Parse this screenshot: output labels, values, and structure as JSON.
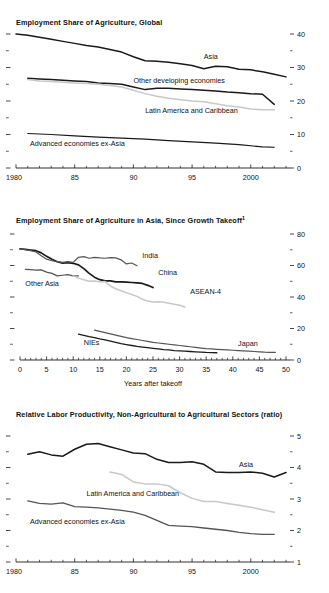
{
  "figure": {
    "background": "#ffffff",
    "colors": {
      "black": "#1a1a1a",
      "dark_gray": "#555555",
      "mid_gray": "#808080",
      "light_gray": "#c8c8c8",
      "axis": "#1a1a1a"
    }
  },
  "chart_data": [
    {
      "id": "panel1",
      "type": "line",
      "title": "Employment Share of Agriculture, Global",
      "xlabel": "",
      "ylabel": "",
      "xlim": [
        1980,
        2003
      ],
      "ylim": [
        0,
        40
      ],
      "yticks": [
        0,
        10,
        20,
        30,
        40
      ],
      "ytick_labels": [
        "0",
        "10",
        "20",
        "30",
        "40"
      ],
      "y_minor_step": 5,
      "xticks": [
        1980,
        1985,
        1990,
        1995,
        2000
      ],
      "xtick_labels": [
        "1980",
        "85",
        "90",
        "95",
        "2000"
      ],
      "x_minor_step": 1,
      "grid": false,
      "legend_position": "inline-annotations",
      "axis_side": "right",
      "series": [
        {
          "name": "Asia",
          "color": "#1a1a1a",
          "width": 1.5,
          "label_x": 1996.0,
          "label_y": 32.6,
          "x": [
            1980,
            1981,
            1982,
            1983,
            1984,
            1985,
            1986,
            1987,
            1988,
            1989,
            1990,
            1991,
            1992,
            1993,
            1994,
            1995,
            1996,
            1997,
            1998,
            1999,
            2000,
            2001,
            2002,
            2003
          ],
          "values": [
            40.0,
            39.6,
            39.0,
            38.4,
            37.8,
            37.2,
            36.6,
            36.1,
            35.4,
            34.6,
            33.2,
            32.0,
            31.9,
            31.6,
            31.1,
            30.6,
            29.6,
            30.4,
            30.2,
            29.5,
            29.3,
            28.7,
            28.0,
            27.2
          ]
        },
        {
          "name": "Other developing economies",
          "color": "#1a1a1a",
          "width": 1.5,
          "label_x": 1990.0,
          "label_y": 25.3,
          "x": [
            1981,
            1982,
            1983,
            1984,
            1985,
            1986,
            1987,
            1988,
            1989,
            1990,
            1991,
            1992,
            1993,
            1994,
            1995,
            1996,
            1997,
            1998,
            1999,
            2000,
            2001,
            2002
          ],
          "values": [
            26.8,
            26.6,
            26.4,
            26.2,
            26.0,
            25.8,
            25.4,
            25.2,
            25.0,
            24.2,
            23.4,
            23.8,
            23.8,
            23.6,
            23.4,
            23.2,
            23.0,
            22.7,
            22.5,
            22.2,
            22.0,
            19.0
          ]
        },
        {
          "name": "Latin America and Caribbean",
          "color": "#c8c8c8",
          "width": 1.5,
          "label_x": 1991.0,
          "label_y": 16.5,
          "x": [
            1981,
            1982,
            1983,
            1984,
            1985,
            1986,
            1987,
            1988,
            1989,
            1990,
            1991,
            1992,
            1993,
            1994,
            1995,
            1996,
            1997,
            1998,
            1999,
            2000,
            2001,
            2002
          ],
          "values": [
            26.4,
            26.0,
            25.8,
            25.6,
            25.4,
            25.2,
            25.0,
            24.6,
            24.2,
            23.2,
            22.2,
            21.4,
            20.8,
            20.4,
            20.0,
            19.8,
            19.2,
            18.6,
            18.2,
            17.6,
            17.4,
            17.4
          ]
        },
        {
          "name": "Advanced economies ex-Asia",
          "color": "#1a1a1a",
          "width": 1.2,
          "label_x": 1981.2,
          "label_y": 6.6,
          "x": [
            1981,
            1983,
            1985,
            1987,
            1989,
            1991,
            1993,
            1995,
            1997,
            1999,
            2001,
            2002
          ],
          "values": [
            10.3,
            10.0,
            9.6,
            9.2,
            8.9,
            8.6,
            8.2,
            7.8,
            7.4,
            7.0,
            6.3,
            6.2
          ]
        }
      ]
    },
    {
      "id": "panel2",
      "type": "line",
      "title": "Employment Share of Agriculture in Asia, Since Growth Takeoff",
      "title_footnote": "1",
      "xlabel": "Years after takeoff",
      "ylabel": "",
      "xlim": [
        0,
        50
      ],
      "ylim": [
        0,
        80
      ],
      "yticks": [
        0,
        20,
        40,
        60,
        80
      ],
      "ytick_labels": [
        "0",
        "20",
        "40",
        "60",
        "80"
      ],
      "y_minor_step": 10,
      "xticks": [
        0,
        5,
        10,
        15,
        20,
        25,
        30,
        35,
        40,
        45,
        50
      ],
      "xtick_labels": [
        "0",
        "5",
        "10",
        "15",
        "20",
        "25",
        "30",
        "35",
        "40",
        "45",
        "50"
      ],
      "x_minor_step": 1,
      "grid": false,
      "legend_position": "inline-annotations",
      "axis_side": "right",
      "series": [
        {
          "name": "China",
          "color": "#1a1a1a",
          "width": 1.7,
          "label_x": 26.0,
          "label_y": 54.0,
          "x": [
            0,
            1,
            2,
            3,
            4,
            5,
            6,
            7,
            8,
            9,
            10,
            11,
            12,
            13,
            14,
            15,
            16,
            17,
            18,
            19,
            20,
            21,
            22,
            23,
            24,
            25
          ],
          "values": [
            70.5,
            70.2,
            69.8,
            69.4,
            68.0,
            65.8,
            64.0,
            62.4,
            61.5,
            61.8,
            61.4,
            60.4,
            58.0,
            55.0,
            52.6,
            51.0,
            50.2,
            50.2,
            49.6,
            49.6,
            49.4,
            49.2,
            49.0,
            48.6,
            47.4,
            46.0
          ]
        },
        {
          "name": "India",
          "color": "#555555",
          "width": 1.2,
          "label_x": 23.0,
          "label_y": 64.5,
          "x": [
            0,
            1,
            2,
            3,
            4,
            5,
            6,
            7,
            8,
            9,
            10,
            11,
            12,
            13,
            14,
            15,
            16,
            17,
            18,
            19,
            20,
            21,
            22
          ],
          "values": [
            70.5,
            70.0,
            69.4,
            68.6,
            66.2,
            64.0,
            63.0,
            62.4,
            62.0,
            62.4,
            62.0,
            65.2,
            65.6,
            64.6,
            65.2,
            64.8,
            64.6,
            65.0,
            64.8,
            63.6,
            61.0,
            61.6,
            59.8
          ]
        },
        {
          "name": "Other Asia",
          "color": "#555555",
          "width": 1.2,
          "label_x": 1.0,
          "label_y": 47.0,
          "x": [
            1,
            2,
            3,
            4,
            5,
            6,
            7,
            8,
            9,
            10,
            11
          ],
          "values": [
            57.6,
            57.4,
            57.0,
            57.2,
            55.8,
            55.0,
            53.4,
            53.8,
            54.2,
            53.4,
            53.4
          ]
        },
        {
          "name": "ASEAN-4",
          "color": "#c8c8c8",
          "width": 1.5,
          "label_x": 32.0,
          "label_y": 42.0,
          "x": [
            10,
            11,
            12,
            13,
            14,
            15,
            16,
            17,
            18,
            19,
            20,
            21,
            22,
            23,
            24,
            25,
            26,
            27,
            28,
            29,
            30,
            31
          ],
          "values": [
            53.4,
            52.0,
            51.0,
            50.0,
            50.2,
            49.6,
            49.8,
            47.0,
            45.2,
            44.0,
            42.8,
            41.6,
            40.4,
            38.6,
            37.4,
            36.8,
            37.0,
            36.6,
            36.0,
            35.4,
            34.8,
            33.6
          ]
        },
        {
          "name": "NIEs",
          "color": "#1a1a1a",
          "width": 1.3,
          "label_x": 12.0,
          "label_y": 9.4,
          "x": [
            11,
            12,
            13,
            14,
            15,
            16,
            17,
            18,
            19,
            20,
            21,
            22,
            23,
            24,
            25,
            26,
            27,
            28,
            29,
            30,
            31,
            32,
            33,
            34,
            35,
            36,
            37
          ],
          "values": [
            16.4,
            15.6,
            14.8,
            14.2,
            13.4,
            12.8,
            12.0,
            11.2,
            10.4,
            9.8,
            9.2,
            8.6,
            8.2,
            7.8,
            7.4,
            7.0,
            6.6,
            6.4,
            6.0,
            5.8,
            5.6,
            5.4,
            5.2,
            5.0,
            4.8,
            4.7,
            4.6
          ]
        },
        {
          "name": "Japan",
          "color": "#555555",
          "width": 1.2,
          "label_x": 41.0,
          "label_y": 9.0,
          "x": [
            14,
            15,
            16,
            17,
            18,
            19,
            20,
            21,
            22,
            23,
            24,
            25,
            26,
            27,
            28,
            29,
            30,
            31,
            32,
            33,
            34,
            35,
            36,
            37,
            38,
            39,
            40,
            41,
            42,
            43,
            44,
            45,
            46,
            47,
            48
          ],
          "values": [
            19.0,
            18.2,
            17.4,
            16.6,
            15.8,
            15.0,
            14.2,
            13.6,
            13.0,
            12.4,
            11.8,
            11.2,
            10.8,
            10.4,
            10.0,
            9.6,
            9.2,
            8.8,
            8.4,
            8.0,
            7.6,
            7.2,
            7.0,
            6.8,
            6.6,
            6.4,
            6.2,
            6.0,
            5.8,
            5.6,
            5.4,
            5.2,
            5.0,
            4.9,
            4.8
          ]
        }
      ]
    },
    {
      "id": "panel3",
      "type": "line",
      "title": "Relative Labor Productivity, Non-Agricultural to Agricultural Sectors (ratio)",
      "xlabel": "",
      "ylabel": "",
      "xlim": [
        1980,
        2003
      ],
      "ylim": [
        1,
        5
      ],
      "yticks": [
        1,
        2,
        3,
        4,
        5
      ],
      "ytick_labels": [
        "1",
        "2",
        "3",
        "4",
        "5"
      ],
      "y_minor_step": 0.5,
      "xticks": [
        1980,
        1985,
        1990,
        1995,
        2000
      ],
      "xtick_labels": [
        "1980",
        "85",
        "90",
        "95",
        "2000"
      ],
      "x_minor_step": 1,
      "grid": false,
      "legend_position": "inline-annotations",
      "axis_side": "right",
      "series": [
        {
          "name": "Asia",
          "color": "#1a1a1a",
          "width": 1.5,
          "label_x": 1999.0,
          "label_y": 4.03,
          "x": [
            1981,
            1982,
            1983,
            1984,
            1985,
            1986,
            1987,
            1988,
            1989,
            1990,
            1991,
            1992,
            1993,
            1994,
            1995,
            1996,
            1997,
            1998,
            1999,
            2000,
            2001,
            2002,
            2003
          ],
          "values": [
            4.42,
            4.5,
            4.4,
            4.36,
            4.58,
            4.74,
            4.76,
            4.66,
            4.56,
            4.46,
            4.44,
            4.26,
            4.16,
            4.16,
            4.18,
            4.1,
            3.86,
            3.84,
            3.84,
            3.86,
            3.82,
            3.7,
            3.84
          ]
        },
        {
          "name": "Latin America and Caribbean",
          "color": "#c8c8c8",
          "width": 1.5,
          "label_x": 1986.0,
          "label_y": 3.08,
          "x": [
            1988,
            1989,
            1990,
            1991,
            1992,
            1993,
            1994,
            1995,
            1996,
            1997,
            1998,
            1999,
            2000,
            2001,
            2002
          ],
          "values": [
            3.86,
            3.78,
            3.54,
            3.48,
            3.48,
            3.42,
            3.2,
            3.02,
            2.92,
            2.92,
            2.86,
            2.8,
            2.74,
            2.66,
            2.58
          ]
        },
        {
          "name": "Advanced economies ex-Asia",
          "color": "#555555",
          "width": 1.3,
          "label_x": 1981.2,
          "label_y": 2.2,
          "x": [
            1981,
            1982,
            1983,
            1984,
            1985,
            1986,
            1987,
            1988,
            1989,
            1990,
            1991,
            1992,
            1993,
            1994,
            1995,
            1996,
            1997,
            1998,
            1999,
            2000,
            2001,
            2002
          ],
          "values": [
            2.94,
            2.86,
            2.84,
            2.88,
            2.76,
            2.74,
            2.72,
            2.68,
            2.64,
            2.58,
            2.48,
            2.32,
            2.16,
            2.14,
            2.12,
            2.08,
            2.04,
            2.0,
            1.94,
            1.9,
            1.88,
            1.88
          ]
        }
      ]
    }
  ]
}
